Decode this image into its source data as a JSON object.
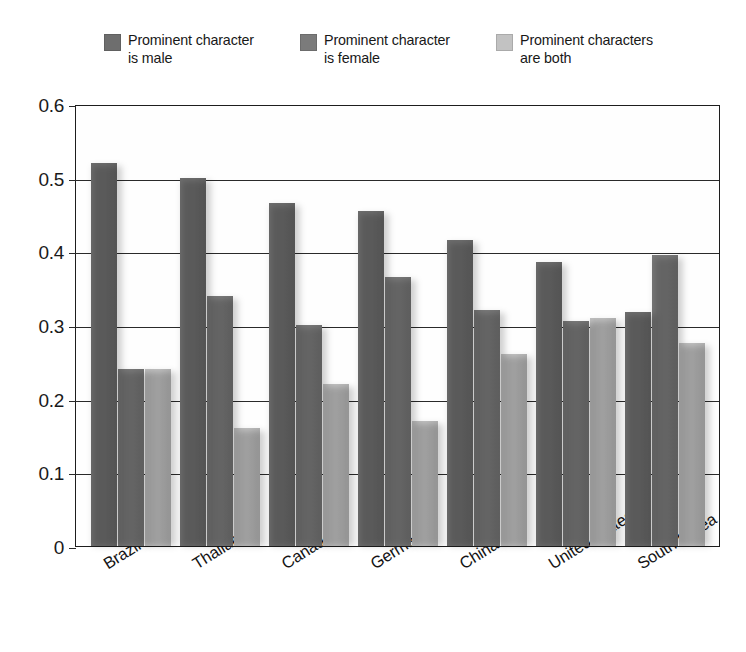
{
  "legend": {
    "position": "top",
    "items": [
      {
        "label": "Prominent character\nis male",
        "color": "#6e6e6e",
        "icon": "legend-swatch-icon"
      },
      {
        "label": "Prominent character\nis female",
        "color": "#7b7b7b",
        "icon": "legend-swatch-icon"
      },
      {
        "label": "Prominent characters\nare both",
        "color": "#c2c2c2",
        "icon": "legend-swatch-icon"
      }
    ]
  },
  "chart_data": {
    "type": "bar",
    "title": "",
    "subtitle": "",
    "xlabel": "",
    "ylabel": "",
    "ylim": [
      0,
      0.6
    ],
    "yticks": [
      "0",
      "0.1",
      "0.2",
      "0.3",
      "0.4",
      "0.5",
      "0.6"
    ],
    "ytick_values": [
      0,
      0.1,
      0.2,
      0.3,
      0.4,
      0.5,
      0.6
    ],
    "grid": true,
    "legend_position": "top",
    "categories": [
      "Brazil",
      "Thailand",
      "Canada",
      "Germany",
      "China",
      "United States",
      "South Korea"
    ],
    "series": [
      {
        "name": "Prominent character is male",
        "color": "#6e6e6e",
        "values": [
          0.52,
          0.5,
          0.465,
          0.455,
          0.415,
          0.385,
          0.318
        ]
      },
      {
        "name": "Prominent character is female",
        "color": "#7b7b7b",
        "values": [
          0.24,
          0.34,
          0.3,
          0.365,
          0.32,
          0.305,
          0.395
        ]
      },
      {
        "name": "Prominent characters are both",
        "color": "#c2c2c2",
        "values": [
          0.24,
          0.16,
          0.22,
          0.17,
          0.26,
          0.31,
          0.275
        ]
      }
    ]
  }
}
